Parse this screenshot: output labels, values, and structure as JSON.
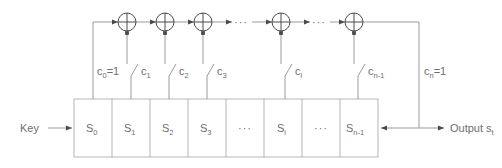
{
  "diagram": {
    "colors": {
      "background": "#ffffff",
      "wire": "#9a9a9a",
      "box_stroke": "#b5b5b5",
      "text": "#6e6e6e",
      "arrow_fill": "#4a4a4a"
    },
    "input_label": "Key",
    "output_label": "Output",
    "output_symbol": "s",
    "output_subscript": "t",
    "ellipsis": "···",
    "registers": [
      {
        "id": "s0",
        "base": "S",
        "sub": "0",
        "kind": "cell"
      },
      {
        "id": "s1",
        "base": "S",
        "sub": "1",
        "kind": "cell"
      },
      {
        "id": "s2",
        "base": "S",
        "sub": "2",
        "kind": "cell"
      },
      {
        "id": "s3",
        "base": "S",
        "sub": "3",
        "kind": "cell"
      },
      {
        "id": "gap1",
        "base": "",
        "sub": "",
        "kind": "ellipsis"
      },
      {
        "id": "si",
        "base": "S",
        "sub": "i",
        "kind": "cell"
      },
      {
        "id": "gap2",
        "base": "",
        "sub": "",
        "kind": "ellipsis"
      },
      {
        "id": "sn1",
        "base": "S",
        "sub": "n-1",
        "kind": "cell"
      }
    ],
    "coefficients": [
      {
        "id": "c0",
        "base": "c",
        "sub": "0",
        "eq": "=1",
        "switch": false
      },
      {
        "id": "c1",
        "base": "c",
        "sub": "1",
        "eq": "",
        "switch": true
      },
      {
        "id": "c2",
        "base": "c",
        "sub": "2",
        "eq": "",
        "switch": true
      },
      {
        "id": "c3",
        "base": "c",
        "sub": "3",
        "eq": "",
        "switch": true
      },
      {
        "id": "ci",
        "base": "c",
        "sub": "i",
        "eq": "",
        "switch": true
      },
      {
        "id": "cn1",
        "base": "c",
        "sub": "n-1",
        "eq": "",
        "switch": true
      },
      {
        "id": "cn",
        "base": "c",
        "sub": "n",
        "eq": "=1",
        "switch": false
      }
    ],
    "xor_gates": [
      {
        "id": "xor-1"
      },
      {
        "id": "xor-2"
      },
      {
        "id": "xor-3"
      },
      {
        "id": "xor-4"
      },
      {
        "id": "xor-5"
      }
    ],
    "top_ellipses": [
      {
        "id": "top-gap-1"
      },
      {
        "id": "top-gap-2"
      }
    ]
  }
}
